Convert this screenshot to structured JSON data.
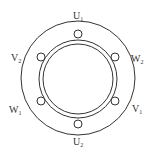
{
  "diagram": {
    "type": "motor-terminal-layout",
    "colors": {
      "stroke": "#333333",
      "background": "#ffffff"
    },
    "terminals": [
      {
        "id": "U1",
        "letter": "U",
        "sub": "1",
        "position": "top"
      },
      {
        "id": "W2",
        "letter": "W",
        "sub": "2",
        "position": "upper-right"
      },
      {
        "id": "V1",
        "letter": "V",
        "sub": "1",
        "position": "lower-right"
      },
      {
        "id": "U2",
        "letter": "U",
        "sub": "2",
        "position": "bottom"
      },
      {
        "id": "W1",
        "letter": "W",
        "sub": "1",
        "position": "lower-left"
      },
      {
        "id": "V2",
        "letter": "V",
        "sub": "2",
        "position": "upper-left"
      }
    ]
  }
}
